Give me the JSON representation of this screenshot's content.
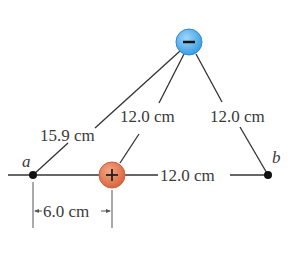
{
  "diagram": {
    "charges": [
      {
        "id": "negative",
        "sign": "−",
        "x": 189,
        "y": 42,
        "r": 13,
        "fill": "#4aa8e8",
        "stroke": "#2e8bd0"
      },
      {
        "id": "positive",
        "sign": "+",
        "x": 112,
        "y": 175,
        "r": 13,
        "fill": "#e07a55",
        "stroke": "#c9603d"
      }
    ],
    "points": [
      {
        "id": "a",
        "label": "a",
        "x": 33,
        "y": 175
      },
      {
        "id": "b",
        "label": "b",
        "x": 268,
        "y": 175
      }
    ],
    "distances": {
      "neg_to_a": "15.9 cm",
      "neg_to_pos": "12.0 cm",
      "neg_to_b": "12.0 cm",
      "pos_to_b": "12.0 cm",
      "a_to_pos": "6.0 cm"
    }
  }
}
